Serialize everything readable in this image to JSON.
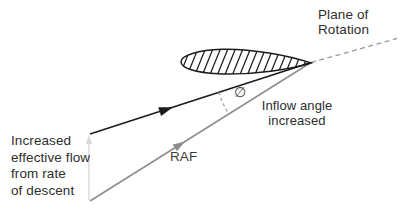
{
  "colors": {
    "ink": "#1c1c1c",
    "raf_gray": "#8c8c8c",
    "dash_gray": "#999999",
    "faint_gray": "#d8d8d8",
    "text": "#2e2e2e"
  },
  "labels": {
    "plane_of_rotation": {
      "line1": "Plane of",
      "line2": "Rotation"
    },
    "inflow_angle": {
      "line1": "Inflow angle",
      "line2": "increased"
    },
    "raf": "RAF",
    "angle_symbol": "∅",
    "effective_flow": {
      "line1": "Increased",
      "line2": "effective flow",
      "line3": "from rate",
      "line4": "of descent"
    }
  }
}
